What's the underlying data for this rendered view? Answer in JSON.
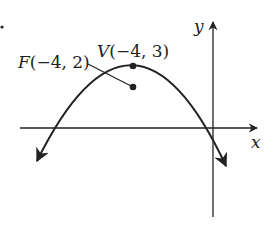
{
  "chart_data": {
    "type": "diagram",
    "axes": {
      "x_label": "x",
      "y_label": "y"
    },
    "curve": {
      "shape": "parabola opening downward",
      "vertex": [
        -4,
        3
      ],
      "focus": [
        -4,
        2
      ]
    },
    "points": [
      {
        "name": "V",
        "coords": [
          -4,
          3
        ],
        "label": "V(−4, 3)"
      },
      {
        "name": "F",
        "coords": [
          -4,
          2
        ],
        "label": "F(−4, 2)"
      }
    ]
  },
  "labels": {
    "x_axis": "x",
    "y_axis": "y",
    "vertex": "V(−4, 3)",
    "focus": "F(−4, 2)"
  },
  "colors": {
    "ink": "#222222",
    "background": "#ffffff"
  }
}
